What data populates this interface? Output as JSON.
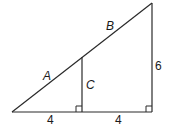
{
  "diagram": {
    "type": "similar-right-triangles",
    "labels": {
      "hyp_lower": "A",
      "hyp_upper": "B",
      "inner_height": "C",
      "outer_height": "6",
      "base_left": "4",
      "base_right": "4"
    },
    "right_angle_markers": 2,
    "colors": {
      "stroke": "#2a2a2a",
      "text": "#1a1a1a",
      "background": "#ffffff"
    }
  }
}
